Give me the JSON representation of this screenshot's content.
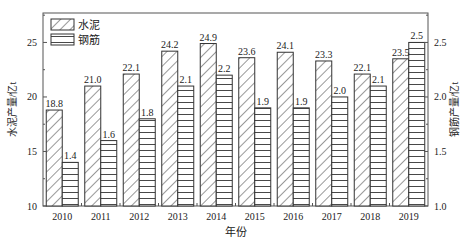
{
  "chart_data": {
    "type": "bar",
    "title": "",
    "xlabel": "年份",
    "ylabel": "水泥产量/亿t",
    "ylabel_right": "钢筋产量/亿t",
    "categories": [
      "2010",
      "2011",
      "2012",
      "2013",
      "2014",
      "2015",
      "2016",
      "2017",
      "2018",
      "2019"
    ],
    "series": [
      {
        "name": "水泥",
        "axis": "left",
        "pattern": "diagonal-hatch",
        "values": [
          18.8,
          21.0,
          22.1,
          24.2,
          24.9,
          23.6,
          24.1,
          23.3,
          22.1,
          23.5
        ]
      },
      {
        "name": "钢筋",
        "axis": "right",
        "pattern": "horizontal-lines",
        "values": [
          1.4,
          1.6,
          1.8,
          2.1,
          2.2,
          1.9,
          1.9,
          2.0,
          2.1,
          2.5
        ]
      }
    ],
    "ylim": [
      10,
      27.7
    ],
    "ylim_right": [
      1.0,
      2.77
    ],
    "yticks": [
      10,
      15,
      20,
      25
    ],
    "yticks_right": [
      1.0,
      1.5,
      2.0,
      2.5
    ],
    "ytick_labels_right": [
      "1.0",
      "1.5",
      "2.0",
      "2.5"
    ],
    "grid": false,
    "legend_position": "upper-left"
  },
  "colors": {
    "stroke": "#333333",
    "background": "#ffffff"
  }
}
